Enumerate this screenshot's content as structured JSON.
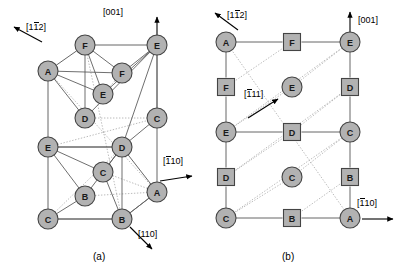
{
  "figure": {
    "background": "#ffffff",
    "node_fill": "#b2b2b2",
    "node_stroke": "#444444",
    "edge_color": "#555555",
    "dotted_color": "#a8a8a8",
    "arrow_color": "#000000"
  },
  "panels": [
    {
      "id": "a",
      "caption": "(a)",
      "caption_pos": {
        "x": 103,
        "y": 257
      },
      "type": "perspective-cell",
      "directions": [
        {
          "label": "[112]",
          "label_html": "[1<span class=\"bar\">1</span>2]",
          "bar_index": 1,
          "label_pos": {
            "x": 26,
            "y": 27
          },
          "arrow": {
            "x1": 42,
            "y1": 42,
            "x2": 14,
            "y2": 27
          }
        },
        {
          "label": "[001]",
          "label_html": "[001]",
          "bar_index": -1,
          "label_pos": {
            "x": 103,
            "y": 13
          },
          "arrow": {
            "x1": 157,
            "y1": 48,
            "x2": 157,
            "y2": 17
          }
        },
        {
          "label": "[110]",
          "label_html": "[<span class=\"bar\">1</span>10]",
          "bar_index": 0,
          "label_pos": {
            "x": 163,
            "y": 161
          },
          "arrow": {
            "x1": 160,
            "y1": 181,
            "x2": 192,
            "y2": 176
          }
        },
        {
          "label": "[110]",
          "label_html": "[110]",
          "bar_index": -1,
          "label_pos": {
            "x": 138,
            "y": 235
          },
          "arrow": {
            "x1": 130,
            "y1": 227,
            "x2": 152,
            "y2": 249
          }
        }
      ],
      "nodes": [
        {
          "id": "a-F-top",
          "label": "F",
          "shape": "circle",
          "x": 85,
          "y": 45,
          "r": 10
        },
        {
          "id": "a-E-topright",
          "label": "E",
          "shape": "circle",
          "x": 157,
          "y": 45,
          "r": 10
        },
        {
          "id": "a-A-left",
          "label": "A",
          "shape": "circle",
          "x": 48,
          "y": 71,
          "r": 10
        },
        {
          "id": "a-F-inner",
          "label": "F",
          "shape": "circle",
          "x": 122,
          "y": 73,
          "r": 10
        },
        {
          "id": "a-E-inner",
          "label": "E",
          "shape": "circle",
          "x": 103,
          "y": 94,
          "r": 10
        },
        {
          "id": "a-D-inner",
          "label": "D",
          "shape": "circle",
          "x": 85,
          "y": 118,
          "r": 10
        },
        {
          "id": "a-C-right",
          "label": "C",
          "shape": "circle",
          "x": 157,
          "y": 118,
          "r": 10
        },
        {
          "id": "a-E-left",
          "label": "E",
          "shape": "circle",
          "x": 48,
          "y": 147,
          "r": 10
        },
        {
          "id": "a-D-mid",
          "label": "D",
          "shape": "circle",
          "x": 122,
          "y": 147,
          "r": 10
        },
        {
          "id": "a-C-inner",
          "label": "C",
          "shape": "circle",
          "x": 103,
          "y": 172,
          "r": 10
        },
        {
          "id": "a-B-inner",
          "label": "B",
          "shape": "circle",
          "x": 85,
          "y": 196,
          "r": 10
        },
        {
          "id": "a-A-right",
          "label": "A",
          "shape": "circle",
          "x": 157,
          "y": 192,
          "r": 10
        },
        {
          "id": "a-C-bottom",
          "label": "C",
          "shape": "circle",
          "x": 48,
          "y": 219,
          "r": 10
        },
        {
          "id": "a-B-bottom",
          "label": "B",
          "shape": "circle",
          "x": 122,
          "y": 219,
          "r": 10
        }
      ],
      "frame_edges": [
        {
          "from": "a-A-left",
          "to": "a-F-top"
        },
        {
          "from": "a-F-top",
          "to": "a-E-topright"
        },
        {
          "from": "a-A-left",
          "to": "a-E-left"
        },
        {
          "from": "a-E-left",
          "to": "a-C-bottom"
        },
        {
          "from": "a-E-topright",
          "to": "a-C-right"
        },
        {
          "from": "a-C-right",
          "to": "a-A-right"
        },
        {
          "from": "a-A-right",
          "to": "a-B-bottom"
        },
        {
          "from": "a-C-bottom",
          "to": "a-B-bottom"
        },
        {
          "from": "a-E-left",
          "to": "a-D-mid"
        },
        {
          "from": "a-D-mid",
          "to": "a-A-right"
        }
      ],
      "slip_edges": [
        {
          "from": "a-A-left",
          "to": "a-D-inner"
        },
        {
          "from": "a-F-top",
          "to": "a-D-inner"
        },
        {
          "from": "a-F-top",
          "to": "a-E-inner"
        },
        {
          "from": "a-F-top",
          "to": "a-F-inner"
        },
        {
          "from": "a-A-left",
          "to": "a-E-inner"
        },
        {
          "from": "a-E-topright",
          "to": "a-F-inner"
        },
        {
          "from": "a-E-topright",
          "to": "a-E-inner"
        },
        {
          "from": "a-E-topright",
          "to": "a-D-inner"
        },
        {
          "from": "a-E-topright",
          "to": "a-D-mid"
        },
        {
          "from": "a-E-topright",
          "to": "a-C-right"
        },
        {
          "from": "a-E-left",
          "to": "a-D-mid"
        },
        {
          "from": "a-E-left",
          "to": "a-C-inner"
        },
        {
          "from": "a-E-left",
          "to": "a-B-inner"
        },
        {
          "from": "a-D-mid",
          "to": "a-C-inner"
        },
        {
          "from": "a-D-mid",
          "to": "a-B-inner"
        },
        {
          "from": "a-D-mid",
          "to": "a-B-bottom"
        },
        {
          "from": "a-C-bottom",
          "to": "a-B-inner"
        },
        {
          "from": "a-C-bottom",
          "to": "a-B-bottom"
        },
        {
          "from": "a-B-bottom",
          "to": "a-C-inner"
        },
        {
          "from": "a-A-right",
          "to": "a-B-bottom"
        },
        {
          "from": "a-C-right",
          "to": "a-D-mid"
        },
        {
          "from": "a-A-left",
          "to": "a-F-inner"
        }
      ],
      "hidden_edges": [
        {
          "from": "a-F-top",
          "to": "a-B-bottom"
        },
        {
          "from": "a-A-left",
          "to": "a-A-right"
        },
        {
          "from": "a-E-left",
          "to": "a-C-right"
        },
        {
          "from": "a-C-bottom",
          "to": "a-D-mid"
        },
        {
          "from": "a-D-inner",
          "to": "a-C-right"
        },
        {
          "from": "a-E-inner",
          "to": "a-F-inner"
        },
        {
          "from": "a-C-inner",
          "to": "a-A-right"
        },
        {
          "from": "a-B-inner",
          "to": "a-A-right"
        }
      ]
    },
    {
      "id": "b",
      "caption": "(b)",
      "caption_pos": {
        "x": 292,
        "y": 257
      },
      "type": "projection-grid",
      "directions": [
        {
          "label": "[112]",
          "label_html": "[1<span class=\"bar\">1</span>2]",
          "bar_index": 1,
          "label_pos": {
            "x": 227,
            "y": 15
          },
          "arrow": {
            "x1": 238,
            "y1": 30,
            "x2": 215,
            "y2": 13
          }
        },
        {
          "label": "[001]",
          "label_html": "[001]",
          "bar_index": -1,
          "label_pos": {
            "x": 358,
            "y": 21
          },
          "arrow": {
            "x1": 350,
            "y1": 34,
            "x2": 350,
            "y2": 12
          }
        },
        {
          "label": "[111]",
          "label_html": "[<span class=\"bar\">1</span>11]",
          "bar_index": 0,
          "label_pos": {
            "x": 244,
            "y": 94
          },
          "arrow": {
            "x1": 248,
            "y1": 118,
            "x2": 278,
            "y2": 99
          }
        },
        {
          "label": "[110]",
          "label_html": "[<span class=\"bar\">1</span>10]",
          "bar_index": 0,
          "label_pos": {
            "x": 357,
            "y": 203
          },
          "arrow": {
            "x1": 362,
            "y1": 219,
            "x2": 393,
            "y2": 219
          }
        }
      ],
      "nodes": [
        {
          "id": "b-A-tl",
          "label": "A",
          "shape": "circle",
          "x": 226,
          "y": 42,
          "r": 10
        },
        {
          "id": "b-F-top",
          "label": "F",
          "shape": "square",
          "x": 292,
          "y": 42,
          "s": 17
        },
        {
          "id": "b-E-tr",
          "label": "E",
          "shape": "circle",
          "x": 350,
          "y": 42,
          "r": 10
        },
        {
          "id": "b-F-left",
          "label": "F",
          "shape": "square",
          "x": 226,
          "y": 87,
          "s": 17
        },
        {
          "id": "b-E-mid",
          "label": "E",
          "shape": "circle",
          "x": 292,
          "y": 87,
          "r": 10
        },
        {
          "id": "b-D-right",
          "label": "D",
          "shape": "square",
          "x": 350,
          "y": 87,
          "s": 17
        },
        {
          "id": "b-E-left",
          "label": "E",
          "shape": "circle",
          "x": 226,
          "y": 132,
          "r": 10
        },
        {
          "id": "b-D-mid",
          "label": "D",
          "shape": "square",
          "x": 292,
          "y": 132,
          "s": 17
        },
        {
          "id": "b-C-right",
          "label": "C",
          "shape": "circle",
          "x": 350,
          "y": 132,
          "r": 10
        },
        {
          "id": "b-D-left",
          "label": "D",
          "shape": "square",
          "x": 226,
          "y": 177,
          "s": 17
        },
        {
          "id": "b-C-mid",
          "label": "C",
          "shape": "circle",
          "x": 292,
          "y": 177,
          "r": 10
        },
        {
          "id": "b-B-right",
          "label": "B",
          "shape": "square",
          "x": 350,
          "y": 177,
          "s": 17
        },
        {
          "id": "b-C-bl",
          "label": "C",
          "shape": "circle",
          "x": 226,
          "y": 218,
          "r": 10
        },
        {
          "id": "b-B-bot",
          "label": "B",
          "shape": "square",
          "x": 292,
          "y": 218,
          "s": 17
        },
        {
          "id": "b-A-br",
          "label": "A",
          "shape": "circle",
          "x": 350,
          "y": 218,
          "r": 10
        }
      ],
      "solid_edges": [
        {
          "from": "b-A-tl",
          "to": "b-F-top"
        },
        {
          "from": "b-F-top",
          "to": "b-E-tr"
        },
        {
          "from": "b-A-tl",
          "to": "b-F-left"
        },
        {
          "from": "b-F-left",
          "to": "b-E-left"
        },
        {
          "from": "b-E-left",
          "to": "b-D-left"
        },
        {
          "from": "b-D-left",
          "to": "b-C-bl"
        },
        {
          "from": "b-E-tr",
          "to": "b-D-right"
        },
        {
          "from": "b-D-right",
          "to": "b-C-right"
        },
        {
          "from": "b-C-right",
          "to": "b-B-right"
        },
        {
          "from": "b-B-right",
          "to": "b-A-br"
        },
        {
          "from": "b-E-left",
          "to": "b-D-mid"
        },
        {
          "from": "b-D-mid",
          "to": "b-C-right"
        },
        {
          "from": "b-C-bl",
          "to": "b-B-bot"
        },
        {
          "from": "b-B-bot",
          "to": "b-A-br"
        }
      ],
      "dotted_edges": [
        {
          "from": "b-F-top",
          "to": "b-F-left"
        },
        {
          "from": "b-E-tr",
          "to": "b-E-left"
        },
        {
          "from": "b-E-tr",
          "to": "b-E-mid"
        },
        {
          "from": "b-E-mid",
          "to": "b-E-left"
        },
        {
          "from": "b-D-right",
          "to": "b-D-left"
        },
        {
          "from": "b-D-right",
          "to": "b-D-mid"
        },
        {
          "from": "b-D-mid",
          "to": "b-D-left"
        },
        {
          "from": "b-C-right",
          "to": "b-C-bl"
        },
        {
          "from": "b-C-right",
          "to": "b-C-mid"
        },
        {
          "from": "b-C-mid",
          "to": "b-C-bl"
        },
        {
          "from": "b-B-right",
          "to": "b-B-bot"
        },
        {
          "from": "b-A-br",
          "to": "b-A-tl"
        }
      ]
    }
  ]
}
